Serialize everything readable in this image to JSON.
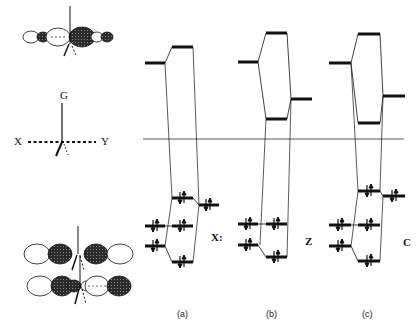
{
  "axis_labels": {
    "g": "G",
    "x": "X",
    "y": "Y"
  },
  "panels": [
    {
      "id": "a",
      "caption": "(a)",
      "state_label": "X:"
    },
    {
      "id": "b",
      "caption": "(b)",
      "state_label": "Z"
    },
    {
      "id": "c",
      "caption": "(c)",
      "state_label": "C"
    }
  ],
  "colors": {
    "ink": "#111111",
    "hatch": "#3a3a3a",
    "line": "#333333"
  }
}
